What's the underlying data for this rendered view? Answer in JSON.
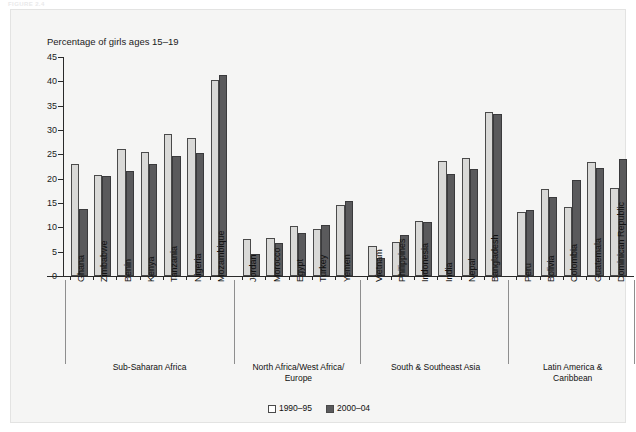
{
  "figure_tag": "FIGURE 2.4",
  "panel": {
    "legend": [
      {
        "label": "1990–95",
        "swatch": "light"
      },
      {
        "label": "2000–04",
        "swatch": "dark"
      }
    ]
  },
  "chart_data": {
    "type": "bar",
    "title": "",
    "ylabel": "Percentage of girls ages 15–19",
    "xlabel": "",
    "ylim": [
      0,
      45
    ],
    "yticks": [
      0,
      5,
      10,
      15,
      20,
      25,
      30,
      35,
      40,
      45
    ],
    "grid": false,
    "legend_position": "bottom-center",
    "colors": {
      "series1": "#d9d9d7",
      "series2": "#5a5a5c",
      "panel_bg": "#f5f5f4",
      "axis": "#2a2a2a"
    },
    "categories": [
      "Ghana",
      "Zimbabwe",
      "Benin",
      "Kenya",
      "Tanzania",
      "Nigeria",
      "Mozambique",
      "Jordan",
      "Morocco",
      "Egypt",
      "Turkey",
      "Yemen",
      "Vietnam",
      "Philippines",
      "Indonesia",
      "India",
      "Nepal",
      "Bangladesh",
      "Peru",
      "Bolivia",
      "Colombia",
      "Guatemala",
      "Dominican Republic"
    ],
    "series": [
      {
        "name": "1990–95",
        "values": [
          23.0,
          20.8,
          26.0,
          25.4,
          29.1,
          28.4,
          40.2,
          7.6,
          7.9,
          10.2,
          9.6,
          14.5,
          6.1,
          6.9,
          11.4,
          23.6,
          24.3,
          33.6,
          13.2,
          17.8,
          14.2,
          23.4,
          18.1
        ]
      },
      {
        "name": "2000–04",
        "values": [
          13.8,
          20.5,
          21.5,
          23.1,
          24.6,
          25.3,
          41.3,
          4.5,
          6.7,
          8.8,
          10.5,
          15.5,
          3.8,
          8.4,
          11.0,
          21.0,
          21.9,
          33.2,
          13.6,
          16.3,
          19.7,
          22.2,
          24.0
        ]
      }
    ],
    "groups": [
      {
        "label": "Sub-Saharan Africa",
        "count": 7
      },
      {
        "label": "North Africa/West Africa/\nEurope",
        "count": 5
      },
      {
        "label": "South & Southeast Asia",
        "count": 6
      },
      {
        "label": "Latin America &\nCaribbean",
        "count": 5
      }
    ]
  }
}
